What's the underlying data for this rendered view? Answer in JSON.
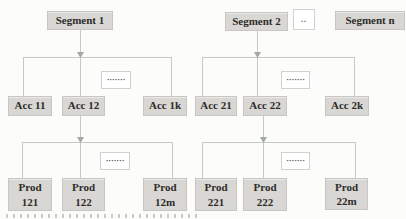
{
  "theme": {
    "page-bg": "#fcfcfa",
    "box-fill": "#d8d7d4",
    "box-border": "#c7c6c3",
    "text-color": "#2e2c29",
    "line-color": "#c4cac4",
    "arrow-color": "#a3a8a3",
    "ellipsis-fill": "#ffffff",
    "ellipsis-border": "#d2d1ce"
  },
  "diagram": {
    "segments": {
      "s1": "Segment 1",
      "s2": "Segment 2",
      "sn": "Segment n",
      "ellipsis": ".."
    },
    "accounts": {
      "a11": "Acc 11",
      "a12": "Acc 12",
      "a1k": "Acc 1k",
      "a21": "Acc 21",
      "a22": "Acc 22",
      "a2k": "Acc 2k"
    },
    "products": {
      "p121": {
        "line1": "Prod",
        "line2": "121"
      },
      "p122": {
        "line1": "Prod",
        "line2": "122"
      },
      "p12m": {
        "line1": "Prod",
        "line2": "12m"
      },
      "p221": {
        "line1": "Prod",
        "line2": "221"
      },
      "p222": {
        "line1": "Prod",
        "line2": "222"
      },
      "p22m": {
        "line1": "Prod",
        "line2": "22m"
      }
    },
    "continuation_dots": "·······"
  }
}
